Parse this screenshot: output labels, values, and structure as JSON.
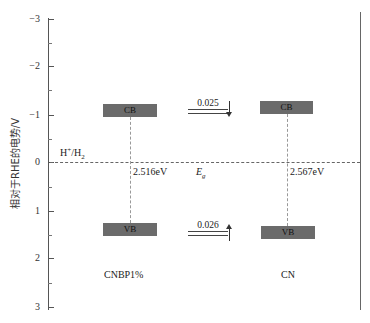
{
  "diagram": {
    "y_axis": {
      "label": "相对于RHE的电势/V",
      "ticks": [
        {
          "label": "−3",
          "y": 19
        },
        {
          "label": "−2",
          "y": 66
        },
        {
          "label": "−1",
          "y": 115
        },
        {
          "label": "0",
          "y": 162
        },
        {
          "label": "1",
          "y": 211
        },
        {
          "label": "2",
          "y": 258
        },
        {
          "label": "3",
          "y": 307
        }
      ],
      "range": [
        -3,
        3
      ]
    },
    "reference_line": {
      "label_main": "H",
      "label_sup": "+",
      "label_rest": "/H",
      "label_sub": "2",
      "potential": 0
    },
    "materials": [
      {
        "name": "CNBP1%",
        "cb_label": "CB",
        "vb_label": "VB",
        "band_gap": "2.516eV"
      },
      {
        "name": "CN",
        "cb_label": "CB",
        "vb_label": "VB",
        "band_gap": "2.567eV"
      }
    ],
    "center_label": {
      "main": "E",
      "sub": "g"
    },
    "cb_offset": "0.025",
    "vb_offset": "0.026",
    "colors": {
      "band": "#6b6b6b",
      "axis": "#555555"
    }
  }
}
